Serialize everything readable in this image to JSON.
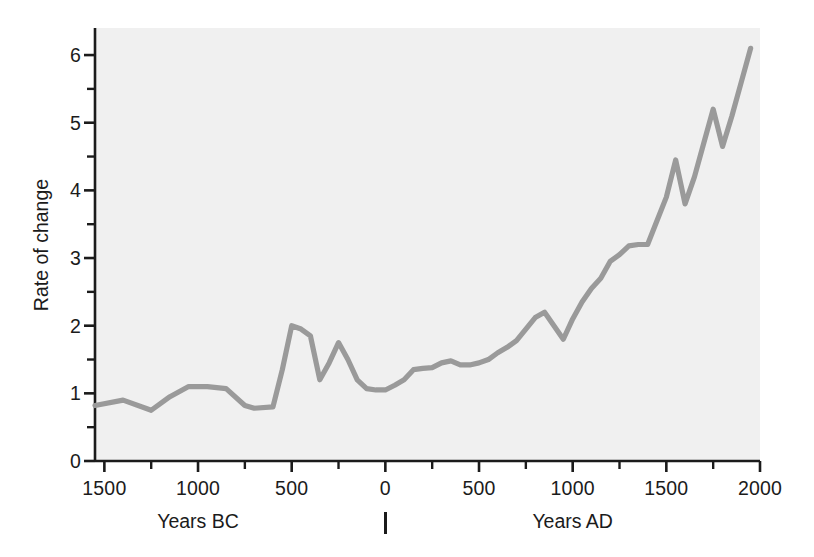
{
  "chart_data": {
    "type": "line",
    "title": "",
    "subtitle": "",
    "xlabel": "Years BC / Years AD",
    "ylabel": "Rate of change",
    "xlim": [
      -1550,
      2000
    ],
    "ylim": [
      0,
      6.4
    ],
    "grid": false,
    "legend": null,
    "series": [
      {
        "name": "Rate of change",
        "color": "#9a9a9a",
        "x": [
          -1550,
          -1400,
          -1250,
          -1150,
          -1050,
          -950,
          -850,
          -750,
          -700,
          -600,
          -550,
          -500,
          -450,
          -400,
          -350,
          -300,
          -250,
          -200,
          -150,
          -100,
          -50,
          0,
          50,
          100,
          150,
          200,
          250,
          300,
          350,
          400,
          450,
          500,
          550,
          600,
          650,
          700,
          750,
          800,
          850,
          900,
          950,
          1000,
          1050,
          1100,
          1150,
          1200,
          1250,
          1300,
          1350,
          1400,
          1450,
          1500,
          1550,
          1600,
          1650,
          1700,
          1750,
          1800,
          1850,
          1900,
          1950
        ],
        "values": [
          0.82,
          0.9,
          0.75,
          0.95,
          1.1,
          1.1,
          1.07,
          0.82,
          0.78,
          0.8,
          1.35,
          2.0,
          1.95,
          1.85,
          1.2,
          1.45,
          1.75,
          1.5,
          1.2,
          1.07,
          1.05,
          1.05,
          1.12,
          1.2,
          1.35,
          1.37,
          1.38,
          1.45,
          1.48,
          1.42,
          1.42,
          1.45,
          1.5,
          1.6,
          1.68,
          1.78,
          1.95,
          2.12,
          2.2,
          2.0,
          1.8,
          2.1,
          2.35,
          2.55,
          2.7,
          2.95,
          3.05,
          3.18,
          3.2,
          3.2,
          3.55,
          3.9,
          4.45,
          3.8,
          4.2,
          4.7,
          5.2,
          4.65,
          5.1,
          5.6,
          6.1
        ]
      }
    ],
    "y_ticks_major": [
      0,
      1,
      2,
      3,
      4,
      5,
      6
    ],
    "y_ticks_minor": [
      0.5,
      1.5,
      2.5,
      3.5,
      4.5,
      5.5
    ],
    "y_tick_labels": [
      "0",
      "1",
      "2",
      "3",
      "4",
      "5",
      "6"
    ],
    "x_ticks_major": [
      -1500,
      -1000,
      -500,
      0,
      500,
      1000,
      1500,
      2000
    ],
    "x_ticks_minor": [
      -1250,
      -750,
      -250,
      250,
      750,
      1250,
      1750
    ],
    "x_tick_labels": [
      "1500",
      "1000",
      "500",
      "0",
      "500",
      "1000",
      "1500",
      "2000"
    ],
    "era_labels": [
      {
        "text": "Years BC",
        "x": -1000
      },
      {
        "text": "Years AD",
        "x": 1000
      }
    ],
    "era_divider_year": 0,
    "colors": {
      "line": "#9a9a9a",
      "axis": "#1b1b1b",
      "panel_background": "#f0f0f0",
      "figure_background": "#ffffff",
      "text": "#1b1b1b"
    }
  }
}
